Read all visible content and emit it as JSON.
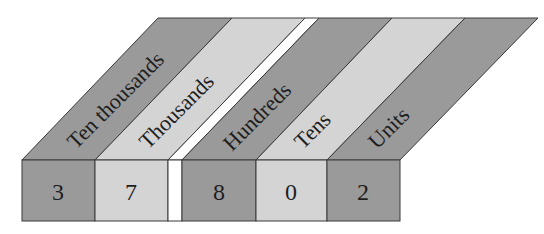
{
  "colors": {
    "dark": "#9a9a9a",
    "light": "#d4d4d4",
    "gap": "#ffffff",
    "stroke": "#3a3a3a",
    "text": "#1e1e1e"
  },
  "columns": [
    {
      "place": "Ten thousands",
      "digit": "3",
      "shade": "dark"
    },
    {
      "place": "Thousands",
      "digit": "7",
      "shade": "light"
    },
    {
      "place": "Hundreds",
      "digit": "8",
      "shade": "dark"
    },
    {
      "place": "Tens",
      "digit": "0",
      "shade": "light"
    },
    {
      "place": "Units",
      "digit": "2",
      "shade": "dark"
    }
  ],
  "number": "37802",
  "separator": {
    "after_column": "Thousands"
  }
}
